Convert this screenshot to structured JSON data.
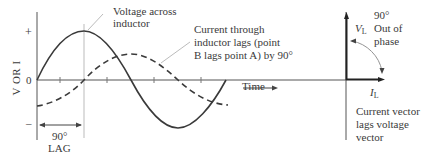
{
  "waveform": {
    "y_axis_label": "V OR I",
    "y_ticks": {
      "plus": "+",
      "zero": "0",
      "minus": "–"
    },
    "x_axis_label": "Time",
    "voltage_label_line1": "Voltage across",
    "voltage_label_line2": "inductor",
    "current_label_line1": "Current through",
    "current_label_line2": "inductor lags (point",
    "current_label_line3": "B lags point A) by 90°",
    "lag_label_angle": "90°",
    "lag_label_text": "LAG"
  },
  "phasor": {
    "voltage_vector": "V",
    "voltage_sub": "L",
    "current_vector": "I",
    "current_sub": "L",
    "phase_angle": "90°",
    "phase_line2": "Out of",
    "phase_line3": "phase",
    "caption_line1": "Current vector",
    "caption_line2": "lags voltage",
    "caption_line3": "vector"
  },
  "colors": {
    "line": "#3a3a3a",
    "guide": "#aaaaaa"
  }
}
